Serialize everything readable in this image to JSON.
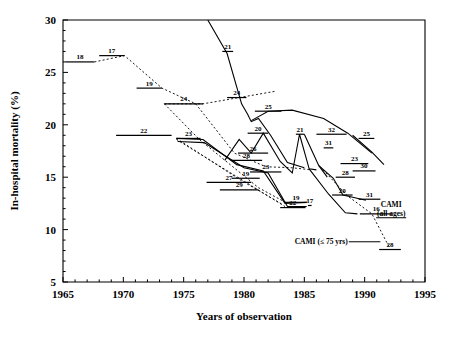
{
  "chart_data": {
    "type": "line",
    "title": "",
    "xlabel": "Years of observation",
    "ylabel": "In-hospital mortality (%)",
    "xlim": [
      1965,
      1995
    ],
    "ylim": [
      5,
      30
    ],
    "xticks": [
      1965,
      1970,
      1975,
      1980,
      1985,
      1990,
      1995
    ],
    "xtick_labels": [
      "1965",
      "1970",
      "1975",
      "1980",
      "1985",
      "1990",
      "1995"
    ],
    "yticks": [
      5,
      10,
      15,
      20,
      25,
      30
    ],
    "ytick_labels": [
      "5",
      "10",
      "15",
      "20",
      "25",
      "30"
    ],
    "grid": false,
    "legend_position": "none",
    "x_minor_tick_interval": 1,
    "y_minor_tick_interval": 1,
    "annotations": [
      {
        "id": "cami-all-ages",
        "text": "CAMI",
        "text2": "(all ages)",
        "x": 1992.2,
        "y": 11.8
      },
      {
        "id": "cami-75yrs",
        "text": "CAMI (≤ 75 yrs)",
        "x": 1988.6,
        "y": 8.6
      }
    ],
    "study_markers": [
      {
        "label": "18",
        "x_start": 1965.2,
        "x_end": 1967.6,
        "y": 26.0
      },
      {
        "label": "17",
        "x_start": 1968.0,
        "x_end": 1970.1,
        "y": 26.6
      },
      {
        "label": "19",
        "x_start": 1971.1,
        "x_end": 1973.2,
        "y": 23.5
      },
      {
        "label": "24",
        "x_start": 1973.4,
        "x_end": 1976.6,
        "y": 22.0
      },
      {
        "label": "22",
        "x_start": 1969.4,
        "x_end": 1974.0,
        "y": 19.0
      },
      {
        "label": "23",
        "x_start": 1974.4,
        "x_end": 1976.4,
        "y": 18.7
      },
      {
        "label": "21",
        "x_start": 1978.2,
        "x_end": 1979.1,
        "y": 27.0
      },
      {
        "label": "24b",
        "x_start": 1978.6,
        "x_end": 1980.2,
        "y": 22.6
      },
      {
        "label": "25",
        "x_start": 1980.9,
        "x_end": 1983.1,
        "y": 21.3
      },
      {
        "label": "20",
        "x_start": 1980.3,
        "x_end": 1982.0,
        "y": 19.2
      },
      {
        "label": "26",
        "x_start": 1979.5,
        "x_end": 1982.0,
        "y": 17.3
      },
      {
        "label": "28",
        "x_start": 1978.9,
        "x_end": 1981.5,
        "y": 16.6
      },
      {
        "label": "27",
        "x_start": 1976.9,
        "x_end": 1980.6,
        "y": 14.5
      },
      {
        "label": "29",
        "x_start": 1978.0,
        "x_end": 1981.2,
        "y": 13.8
      },
      {
        "label": "19b",
        "x_start": 1979.0,
        "x_end": 1981.3,
        "y": 14.9
      },
      {
        "label": "23b",
        "x_start": 1980.5,
        "x_end": 1983.1,
        "y": 15.5
      },
      {
        "label": "19c",
        "x_start": 1983.4,
        "x_end": 1985.2,
        "y": 12.6
      },
      {
        "label": "22b",
        "x_start": 1983.0,
        "x_end": 1985.1,
        "y": 12.1
      },
      {
        "label": "17b",
        "x_start": 1985.3,
        "x_end": 1985.6,
        "y": 12.3
      },
      {
        "label": "21b",
        "x_start": 1984.3,
        "x_end": 1985.0,
        "y": 19.1
      },
      {
        "label": "32",
        "x_start": 1986.0,
        "x_end": 1988.5,
        "y": 19.1
      },
      {
        "label": "31",
        "x_start": 1986.6,
        "x_end": 1987.4,
        "y": 17.8
      },
      {
        "label": "25b",
        "x_start": 1989.5,
        "x_end": 1990.8,
        "y": 18.7
      },
      {
        "label": "23c",
        "x_start": 1988.0,
        "x_end": 1990.3,
        "y": 16.3
      },
      {
        "label": "30",
        "x_start": 1989.0,
        "x_end": 1990.9,
        "y": 15.6
      },
      {
        "label": "28b",
        "x_start": 1987.6,
        "x_end": 1989.2,
        "y": 15.0
      },
      {
        "label": "20b",
        "x_start": 1987.3,
        "x_end": 1989.0,
        "y": 13.3
      },
      {
        "label": "31b",
        "x_start": 1989.5,
        "x_end": 1991.3,
        "y": 12.9
      },
      {
        "label": "16",
        "x_start": 1989.6,
        "x_end": 1992.3,
        "y": 11.5
      },
      {
        "label": "28c",
        "x_start": 1991.2,
        "x_end": 1993.0,
        "y": 8.1
      }
    ],
    "series": [
      {
        "name": "trend-dashed-upper",
        "style": "dashed",
        "points": [
          [
            1967.6,
            26.0
          ],
          [
            1970.1,
            26.6
          ],
          [
            1973.2,
            23.5
          ],
          [
            1976.0,
            22.0
          ],
          [
            1979.2,
            17.3
          ],
          [
            1981.8,
            16.0
          ],
          [
            1984.0,
            15.9
          ],
          [
            1985.6,
            15.7
          ]
        ]
      },
      {
        "name": "trend-dashed-fan-a",
        "style": "dashed",
        "points": [
          [
            1973.4,
            22.0
          ],
          [
            1976.6,
            22.0
          ],
          [
            1982.6,
            23.2
          ]
        ]
      },
      {
        "name": "trend-dashed-fan-b",
        "style": "dashed",
        "points": [
          [
            1973.4,
            22.0
          ],
          [
            1976.3,
            18.6
          ],
          [
            1981.2,
            14.0
          ],
          [
            1983.6,
            12.5
          ]
        ]
      },
      {
        "name": "trend-dashed-fan-c",
        "style": "dashed",
        "points": [
          [
            1974.4,
            18.7
          ],
          [
            1979.6,
            14.8
          ],
          [
            1983.2,
            12.4
          ]
        ]
      },
      {
        "name": "trend-dashed-fan-d",
        "style": "dashed",
        "points": [
          [
            1974.4,
            18.6
          ],
          [
            1980.6,
            14.2
          ],
          [
            1983.4,
            12.2
          ]
        ]
      },
      {
        "name": "trend-solid-21",
        "style": "solid",
        "points": [
          [
            1977.0,
            30.0
          ],
          [
            1978.6,
            26.8
          ],
          [
            1979.4,
            23.6
          ],
          [
            1979.8,
            22.0
          ],
          [
            1980.3,
            21.0
          ],
          [
            1980.6,
            20.3
          ],
          [
            1981.2,
            20.6
          ],
          [
            1982.2,
            19.0
          ],
          [
            1983.6,
            16.4
          ],
          [
            1985.0,
            15.9
          ]
        ]
      },
      {
        "name": "trend-solid-arc-25",
        "style": "solid",
        "points": [
          [
            1980.6,
            20.4
          ],
          [
            1982.0,
            21.3
          ],
          [
            1984.0,
            21.4
          ],
          [
            1986.6,
            20.6
          ],
          [
            1988.6,
            19.2
          ],
          [
            1990.6,
            17.3
          ]
        ]
      },
      {
        "name": "trend-solid-zigzag-20",
        "style": "solid",
        "points": [
          [
            1978.4,
            16.6
          ],
          [
            1979.6,
            18.6
          ],
          [
            1980.6,
            17.3
          ],
          [
            1981.6,
            19.2
          ],
          [
            1983.0,
            16.5
          ],
          [
            1984.0,
            15.4
          ],
          [
            1984.6,
            19.1
          ],
          [
            1985.4,
            15.8
          ],
          [
            1986.0,
            15.7
          ]
        ]
      },
      {
        "name": "trend-solid-23-lower",
        "style": "solid",
        "points": [
          [
            1974.4,
            18.7
          ],
          [
            1976.6,
            18.6
          ],
          [
            1979.4,
            16.2
          ],
          [
            1981.6,
            15.6
          ],
          [
            1983.4,
            12.5
          ],
          [
            1985.2,
            12.6
          ]
        ]
      },
      {
        "name": "trend-solid-23-lower-2",
        "style": "solid",
        "points": [
          [
            1974.5,
            18.4
          ],
          [
            1976.7,
            18.3
          ],
          [
            1980.0,
            15.9
          ],
          [
            1982.0,
            15.4
          ],
          [
            1983.6,
            12.2
          ],
          [
            1985.2,
            12.2
          ]
        ]
      },
      {
        "name": "trend-solid-32-31",
        "style": "solid",
        "points": [
          [
            1985.0,
            19.1
          ],
          [
            1986.2,
            16.1
          ],
          [
            1986.9,
            15.0
          ]
        ]
      },
      {
        "name": "trend-solid-28-31",
        "style": "solid",
        "points": [
          [
            1986.2,
            16.1
          ],
          [
            1987.4,
            14.9
          ],
          [
            1988.2,
            13.3
          ],
          [
            1990.1,
            12.8
          ]
        ]
      },
      {
        "name": "trend-solid-20-down",
        "style": "solid",
        "points": [
          [
            1985.4,
            15.8
          ],
          [
            1987.0,
            13.4
          ],
          [
            1988.4,
            11.6
          ],
          [
            1989.4,
            11.5
          ]
        ]
      },
      {
        "name": "trend-dashed-cami",
        "style": "dashed",
        "points": [
          [
            1986.3,
            16.0
          ],
          [
            1988.6,
            13.2
          ],
          [
            1990.6,
            11.5
          ],
          [
            1992.0,
            8.4
          ]
        ]
      },
      {
        "name": "trend-solid-25-tail",
        "style": "solid",
        "points": [
          [
            1989.0,
            19.0
          ],
          [
            1990.6,
            17.4
          ],
          [
            1991.6,
            16.2
          ]
        ]
      }
    ]
  }
}
